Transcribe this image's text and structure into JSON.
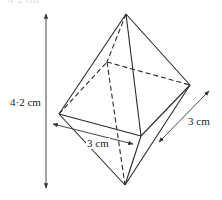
{
  "figure": {
    "cropped_top_text": "4·2 cm",
    "labels": {
      "height": "4·2 cm",
      "base_front": "3 cm",
      "base_side": "3 cm"
    },
    "colors": {
      "line": "#2a2a2a",
      "background": "#ffffff"
    },
    "shape": "octahedron (square bipyramid)",
    "vertices": {
      "top": [
        126,
        14
      ],
      "left": [
        59,
        114
      ],
      "back": [
        107,
        62
      ],
      "right": [
        190,
        85
      ],
      "front": [
        141,
        136
      ],
      "bottom": [
        125,
        185
      ]
    }
  }
}
